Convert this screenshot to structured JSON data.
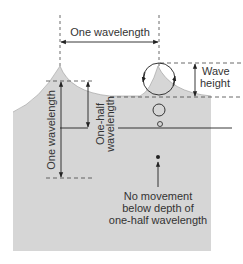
{
  "labels": {
    "one_wavelength_top": "One wavelength",
    "wave_height_line1": "Wave",
    "wave_height_line2": "height",
    "one_wavelength_vertical": "One wavelength",
    "one_half_line1": "One-half",
    "one_half_line2": "wavelength",
    "no_movement_line1": "No movement",
    "no_movement_line2": "below depth of",
    "no_movement_line3": "one-half wavelength"
  },
  "colors": {
    "water": "#d6d6d6",
    "line": "#222222",
    "dash": "#444444",
    "text": "#333333",
    "background": "#ffffff"
  }
}
